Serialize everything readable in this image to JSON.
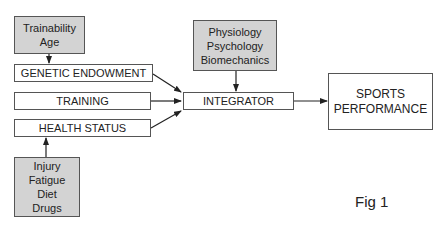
{
  "diagram": {
    "caption": "Fig 1",
    "nodes": {
      "modifiers_genetic": {
        "lines": [
          "Trainability",
          "Age"
        ],
        "style": "gray"
      },
      "genetic_endowment": {
        "label": "GENETIC ENDOWMENT",
        "style": "white"
      },
      "training": {
        "label": "TRAINING",
        "style": "white"
      },
      "health_status": {
        "label": "HEALTH STATUS",
        "style": "white"
      },
      "modifiers_health": {
        "lines": [
          "Injury",
          "Fatigue",
          "Diet",
          "Drugs"
        ],
        "style": "gray"
      },
      "disciplines": {
        "lines": [
          "Physiology",
          "Psychology",
          "Biomechanics"
        ],
        "style": "gray"
      },
      "integrator": {
        "label": "INTEGRATOR",
        "style": "white"
      },
      "outcome": {
        "lines": [
          "SPORTS",
          "PERFORMANCE"
        ],
        "style": "white"
      }
    },
    "edges": [
      {
        "from": "Trainability / Age",
        "to": "GENETIC ENDOWMENT"
      },
      {
        "from": "Injury / Fatigue / Diet / Drugs",
        "to": "HEALTH STATUS"
      },
      {
        "from": "GENETIC ENDOWMENT",
        "to": "INTEGRATOR"
      },
      {
        "from": "TRAINING",
        "to": "INTEGRATOR"
      },
      {
        "from": "HEALTH STATUS",
        "to": "INTEGRATOR"
      },
      {
        "from": "Physiology / Psychology / Biomechanics",
        "to": "INTEGRATOR"
      },
      {
        "from": "INTEGRATOR",
        "to": "SPORTS PERFORMANCE"
      }
    ],
    "colors": {
      "gray_fill": "#d3d3d3",
      "border": "#555555",
      "arrow": "#222222"
    }
  }
}
